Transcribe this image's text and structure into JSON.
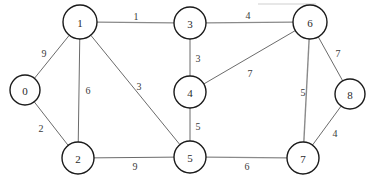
{
  "figure": {
    "background_color": "#ffffff",
    "node_stroke_color": "#1a1a1a",
    "edge_stroke_color": "#6b6b6b",
    "label_color": "#2a2a2a"
  },
  "chart_data": {
    "type": "diagram",
    "graph_type": "weighted-undirected-graph",
    "title": "",
    "node_count": 9,
    "edge_count": 14,
    "nodes": [
      {
        "id": "0",
        "label": "0",
        "x": 25,
        "y": 90,
        "r": 15
      },
      {
        "id": "1",
        "label": "1",
        "x": 80,
        "y": 22,
        "r": 17
      },
      {
        "id": "2",
        "label": "2",
        "x": 78,
        "y": 158,
        "r": 16
      },
      {
        "id": "3",
        "label": "3",
        "x": 190,
        "y": 23,
        "r": 16
      },
      {
        "id": "4",
        "label": "4",
        "x": 190,
        "y": 92,
        "r": 16
      },
      {
        "id": "5",
        "label": "5",
        "x": 190,
        "y": 157,
        "r": 16
      },
      {
        "id": "6",
        "label": "6",
        "x": 310,
        "y": 22,
        "r": 17
      },
      {
        "id": "7",
        "label": "7",
        "x": 303,
        "y": 158,
        "r": 16
      },
      {
        "id": "8",
        "label": "8",
        "x": 350,
        "y": 94,
        "r": 15
      }
    ],
    "edges": [
      {
        "source": "0",
        "target": "1",
        "weight": "9",
        "label_x": 44,
        "label_y": 53,
        "thick": false
      },
      {
        "source": "0",
        "target": "2",
        "weight": "2",
        "label_x": 41,
        "label_y": 128,
        "thick": false
      },
      {
        "source": "1",
        "target": "2",
        "weight": "6",
        "label_x": 88,
        "label_y": 90,
        "thick": false
      },
      {
        "source": "1",
        "target": "3",
        "weight": "1",
        "label_x": 136,
        "label_y": 16,
        "thick": true
      },
      {
        "source": "1",
        "target": "5",
        "weight": "3",
        "label_x": 139,
        "label_y": 86,
        "thick": false
      },
      {
        "source": "3",
        "target": "4",
        "weight": "3",
        "label_x": 198,
        "label_y": 58,
        "thick": false
      },
      {
        "source": "3",
        "target": "6",
        "weight": "4",
        "label_x": 248,
        "label_y": 15,
        "thick": true
      },
      {
        "source": "4",
        "target": "5",
        "weight": "5",
        "label_x": 198,
        "label_y": 126,
        "thick": false
      },
      {
        "source": "4",
        "target": "6",
        "weight": "7",
        "label_x": 250,
        "label_y": 73,
        "thick": false
      },
      {
        "source": "2",
        "target": "5",
        "weight": "9",
        "label_x": 135,
        "label_y": 166,
        "thick": false
      },
      {
        "source": "5",
        "target": "7",
        "weight": "6",
        "label_x": 247,
        "label_y": 166,
        "thick": true
      },
      {
        "source": "6",
        "target": "7",
        "weight": "5",
        "label_x": 303,
        "label_y": 92,
        "thick": true
      },
      {
        "source": "6",
        "target": "8",
        "weight": "7",
        "label_x": 338,
        "label_y": 53,
        "thick": false
      },
      {
        "source": "7",
        "target": "8",
        "weight": "4",
        "label_x": 335,
        "label_y": 133,
        "thick": false
      }
    ],
    "artifacts": [
      {
        "name": "scan-line",
        "x1": 258,
        "y1": 4,
        "x2": 316,
        "y2": 4
      }
    ]
  }
}
